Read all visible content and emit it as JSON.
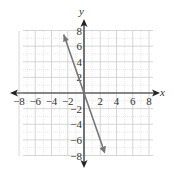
{
  "chart_data": {
    "type": "line",
    "title": "",
    "xlabel": "x",
    "ylabel": "y",
    "xlim": [
      -8,
      8
    ],
    "ylim": [
      -8,
      8
    ],
    "grid": true,
    "x_ticks": [
      "-8",
      "-6",
      "-4",
      "-2",
      "2",
      "4",
      "6",
      "8"
    ],
    "y_ticks": [
      "8",
      "6",
      "4",
      "2",
      "-2",
      "-4",
      "-6",
      "-8"
    ],
    "series": [
      {
        "name": "y = -3x",
        "x": [
          -2.5,
          2.5
        ],
        "y": [
          7.5,
          -7.5
        ],
        "arrows": "both"
      }
    ],
    "colors": {
      "line": "#777777",
      "axis": "#222222",
      "grid_major": "#cccccc",
      "grid_minor": "#e2e2e2"
    }
  }
}
